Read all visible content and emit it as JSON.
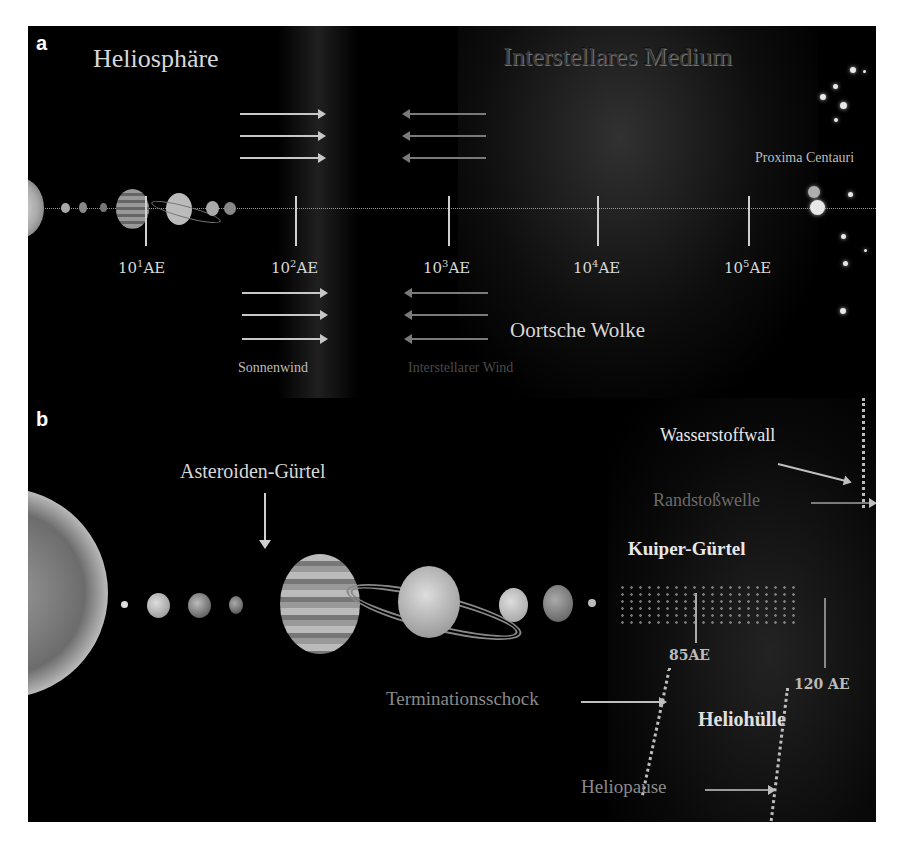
{
  "panel_a": {
    "letter": "a",
    "title_left": "Heliosphäre",
    "title_right": "Interstellares Medium",
    "star_label": "Proxima Centauri",
    "oort_label": "Oortsche Wolke",
    "solar_wind_label": "Sonnenwind",
    "interstellar_wind_label": "Interstellarer Wind",
    "ticks": [
      {
        "base": "10",
        "exp": "1",
        "unit": "AE"
      },
      {
        "base": "10",
        "exp": "2",
        "unit": "AE"
      },
      {
        "base": "10",
        "exp": "3",
        "unit": "AE"
      },
      {
        "base": "10",
        "exp": "4",
        "unit": "AE"
      },
      {
        "base": "10",
        "exp": "5",
        "unit": "AE"
      }
    ]
  },
  "panel_b": {
    "letter": "b",
    "asteroid_label": "Asteroiden-Gürtel",
    "hydrogen_wall_label": "Wasserstoffwall",
    "bow_shock_label": "Randstoßwelle",
    "kuiper_label": "Kuiper-Gürtel",
    "distance_85": "85AE",
    "distance_120": "120 AE",
    "termination_label": "Terminationsschock",
    "heliosheath_label": "Heliohülle",
    "heliopause_label": "Heliopause"
  },
  "colors": {
    "background": "#000000",
    "label_bright": "#e0e0e0",
    "label_dim": "#7a7a7a",
    "page": "#ffffff"
  }
}
